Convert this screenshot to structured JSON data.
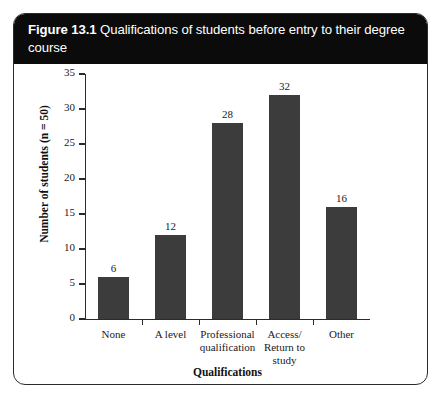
{
  "figure": {
    "number": "Figure 13.1",
    "caption": "Qualifications of students before entry to their degree course"
  },
  "colors": {
    "bar": "#3c3c3c",
    "header_background": "#0b0b0b",
    "header_text": "#ffffff",
    "axis": "#2b2b2b",
    "frame_border": "#2b2b2b",
    "page_background": "#ffffff"
  },
  "chart_data": {
    "type": "bar",
    "title": "Qualifications of students before entry to their degree course",
    "categories": [
      "None",
      "A level",
      "Professional qualification",
      "Access/ Return to study",
      "Other"
    ],
    "values": [
      6,
      12,
      28,
      32,
      16
    ],
    "data_labels": [
      "6",
      "12",
      "28",
      "32",
      "16"
    ],
    "xlabel": "Qualifications",
    "ylabel": "Number of students (n = 50)",
    "ylim": [
      0,
      35
    ],
    "ytick_labels": [
      "0",
      "5",
      "10",
      "15",
      "20",
      "25",
      "30",
      "35"
    ],
    "ytick_values": [
      0,
      5,
      10,
      15,
      20,
      25,
      30,
      35
    ],
    "grid": false,
    "legend": false
  }
}
